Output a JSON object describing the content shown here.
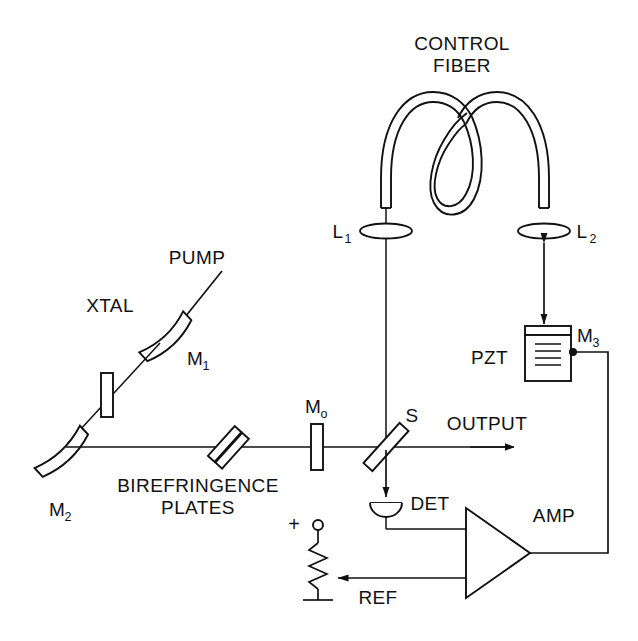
{
  "figure": {
    "title": "CONTROL FIBER",
    "title_lines": [
      "CONTROL",
      "FIBER"
    ],
    "type": "optical-cavity-schematic",
    "background_color": "#ffffff",
    "line_color": "#111111"
  },
  "labels": {
    "control_fiber_line1": "CONTROL",
    "control_fiber_line2": "FIBER",
    "lens_1": "L",
    "lens_1_sub": "1",
    "lens_2": "L",
    "lens_2_sub": "2",
    "pump": "PUMP",
    "xtal": "XTAL",
    "mirror_1": "M",
    "mirror_1_sub": "1",
    "mirror_2": "M",
    "mirror_2_sub": "2",
    "mirror_3": "M",
    "mirror_3_sub": "3",
    "mirror_o": "M",
    "mirror_o_sub": "o",
    "pzt": "PZT",
    "birefringence_line1": "BIREFRINGENCE",
    "birefringence_line2": "PLATES",
    "splitter": "S",
    "output": "OUTPUT",
    "detector": "DET",
    "amplifier": "AMP",
    "reference": "REF",
    "supply_plus": "+"
  },
  "components": [
    {
      "name": "control-fiber",
      "kind": "optical-fiber-loop",
      "label": "CONTROL FIBER"
    },
    {
      "name": "lens-l1",
      "kind": "lens",
      "label": "L1"
    },
    {
      "name": "lens-l2",
      "kind": "lens",
      "label": "L2"
    },
    {
      "name": "mirror-m1",
      "kind": "curved-mirror",
      "label": "M1"
    },
    {
      "name": "mirror-m2",
      "kind": "curved-mirror",
      "label": "M2"
    },
    {
      "name": "mirror-m3",
      "kind": "pzt-mounted-mirror",
      "label": "M3"
    },
    {
      "name": "mirror-m0",
      "kind": "flat-mirror",
      "label": "Mo"
    },
    {
      "name": "crystal-xtal",
      "kind": "laser-crystal",
      "label": "XTAL"
    },
    {
      "name": "pump-beam",
      "kind": "input-beam",
      "label": "PUMP"
    },
    {
      "name": "birefringence-plates",
      "kind": "tilted-plates",
      "label": "BIREFRINGENCE PLATES"
    },
    {
      "name": "beam-splitter-s",
      "kind": "beamsplitter",
      "label": "S"
    },
    {
      "name": "output-beam",
      "kind": "output-beam",
      "label": "OUTPUT"
    },
    {
      "name": "detector-det",
      "kind": "photodiode",
      "label": "DET"
    },
    {
      "name": "amplifier-amp",
      "kind": "amplifier",
      "label": "AMP"
    },
    {
      "name": "pzt-actuator",
      "kind": "piezo-transducer",
      "label": "PZT"
    },
    {
      "name": "reference-pot",
      "kind": "potentiometer",
      "label": "REF"
    },
    {
      "name": "supply-terminal",
      "kind": "voltage-terminal",
      "label": "+"
    },
    {
      "name": "ground-symbol",
      "kind": "ground",
      "label": ""
    }
  ]
}
